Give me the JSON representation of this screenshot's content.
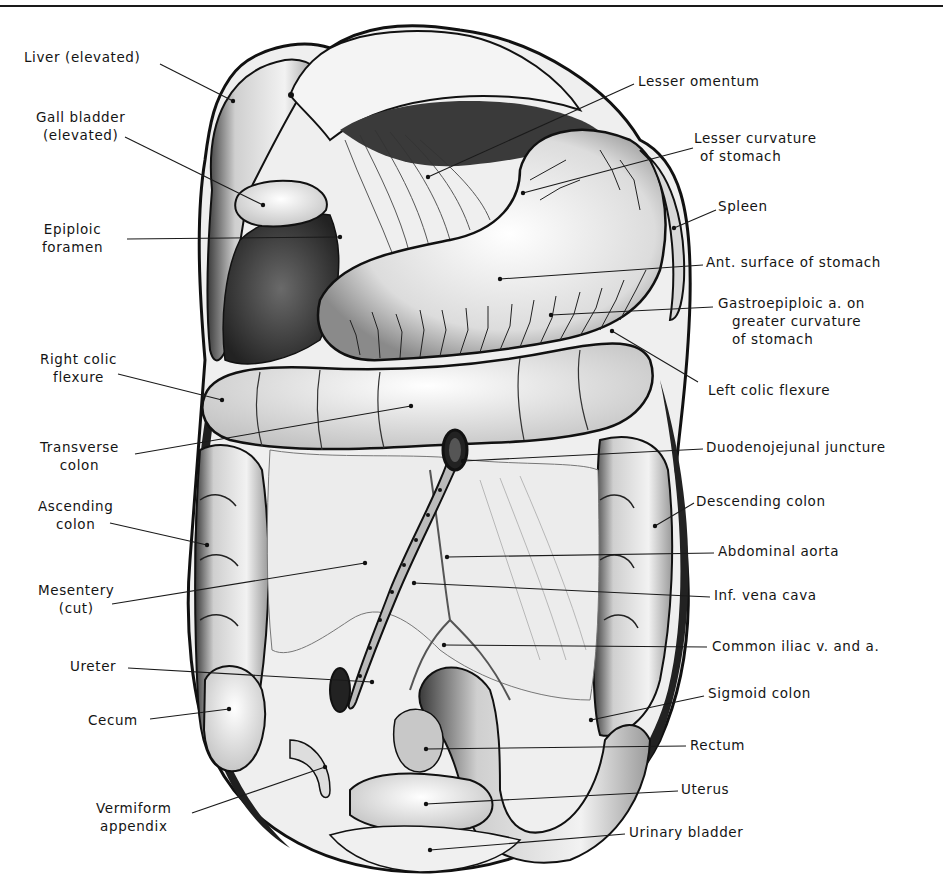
{
  "figure": {
    "colors": {
      "ink": "#141414",
      "paper": "#ffffff",
      "shade": "#6e6e6e",
      "dark": "#2a2a2a",
      "light": "#e4e4e4"
    }
  },
  "labels_left": [
    {
      "id": "liver",
      "line1": "Liver (elevated)",
      "line2": "",
      "x": 24,
      "y": 48,
      "anchor": [
        233,
        101
      ],
      "from": [
        160,
        64
      ]
    },
    {
      "id": "gall-bladder",
      "line1": "Gall bladder",
      "line2": "(elevated)",
      "x": 36,
      "y": 108,
      "anchor": [
        263,
        205
      ],
      "from": [
        125,
        137
      ]
    },
    {
      "id": "epiploic-foramen",
      "line1": "Epiploic",
      "line2": "foramen",
      "x": 42,
      "y": 220,
      "anchor": [
        340,
        237
      ],
      "from": [
        127,
        239
      ]
    },
    {
      "id": "right-colic-flexure",
      "line1": "Right colic",
      "line2": "flexure",
      "x": 40,
      "y": 350,
      "anchor": [
        222,
        400
      ],
      "from": [
        118,
        374
      ]
    },
    {
      "id": "transverse-colon",
      "line1": "Transverse",
      "line2": "colon",
      "x": 40,
      "y": 438,
      "anchor": [
        411,
        406
      ],
      "from": [
        135,
        454
      ]
    },
    {
      "id": "ascending-colon",
      "line1": "Ascending",
      "line2": "colon",
      "x": 38,
      "y": 497,
      "anchor": [
        207,
        545
      ],
      "from": [
        110,
        523
      ]
    },
    {
      "id": "mesentery",
      "line1": "Mesentery",
      "line2": "(cut)",
      "x": 38,
      "y": 581,
      "anchor": [
        365,
        563
      ],
      "from": [
        112,
        604
      ]
    },
    {
      "id": "ureter",
      "line1": "Ureter",
      "line2": "",
      "x": 70,
      "y": 657,
      "anchor": [
        372,
        682
      ],
      "from": [
        128,
        668
      ]
    },
    {
      "id": "cecum",
      "line1": "Cecum",
      "line2": "",
      "x": 88,
      "y": 711,
      "anchor": [
        229,
        709
      ],
      "from": [
        150,
        719
      ]
    },
    {
      "id": "vermiform-appendix",
      "line1": "Vermiform",
      "line2": "appendix",
      "x": 96,
      "y": 799,
      "anchor": [
        325,
        767
      ],
      "from": [
        192,
        813
      ]
    }
  ],
  "labels_right": [
    {
      "id": "lesser-omentum",
      "line1": "Lesser omentum",
      "line2": "",
      "x": 638,
      "y": 72,
      "anchor": [
        428,
        177
      ],
      "from": [
        634,
        84
      ]
    },
    {
      "id": "lesser-curvature",
      "line1": "Lesser curvature",
      "line2": "of stomach",
      "x": 694,
      "y": 129,
      "anchor": [
        523,
        193
      ],
      "from": [
        693,
        148
      ]
    },
    {
      "id": "spleen",
      "line1": "Spleen",
      "line2": "",
      "x": 718,
      "y": 197,
      "anchor": [
        674,
        228
      ],
      "from": [
        716,
        210
      ]
    },
    {
      "id": "ant-surface-stomach",
      "line1": "Ant. surface of stomach",
      "line2": "",
      "x": 706,
      "y": 253,
      "anchor": [
        500,
        279
      ],
      "from": [
        703,
        265
      ]
    },
    {
      "id": "gastroepiploic-artery",
      "line1": "Gastroepiploic a. on",
      "line2": "greater curvature",
      "line3": "of stomach",
      "x": 718,
      "y": 294,
      "anchor": [
        551,
        315
      ],
      "from": [
        713,
        307
      ]
    },
    {
      "id": "left-colic-flexure",
      "line1": "Left colic flexure",
      "line2": "",
      "x": 708,
      "y": 381,
      "anchor": [
        612,
        331
      ],
      "from": [
        698,
        382
      ]
    },
    {
      "id": "duodenojejunal-juncture",
      "line1": "Duodenojejunal juncture",
      "line2": "",
      "x": 706,
      "y": 438,
      "anchor": [
        463,
        461
      ],
      "from": [
        703,
        449
      ]
    },
    {
      "id": "descending-colon",
      "line1": "Descending colon",
      "line2": "",
      "x": 696,
      "y": 492,
      "anchor": [
        655,
        526
      ],
      "from": [
        694,
        503
      ]
    },
    {
      "id": "abdominal-aorta",
      "line1": "Abdominal aorta",
      "line2": "",
      "x": 718,
      "y": 542,
      "anchor": [
        447,
        557
      ],
      "from": [
        714,
        553
      ]
    },
    {
      "id": "inf-vena-cava",
      "line1": "Inf. vena cava",
      "line2": "",
      "x": 714,
      "y": 586,
      "anchor": [
        414,
        583
      ],
      "from": [
        710,
        597
      ]
    },
    {
      "id": "common-iliac",
      "line1": "Common iliac v. and a.",
      "line2": "",
      "x": 712,
      "y": 637,
      "anchor": [
        444,
        645
      ],
      "from": [
        707,
        647
      ]
    },
    {
      "id": "sigmoid-colon",
      "line1": "Sigmoid colon",
      "line2": "",
      "x": 708,
      "y": 684,
      "anchor": [
        591,
        720
      ],
      "from": [
        704,
        696
      ]
    },
    {
      "id": "rectum",
      "line1": "Rectum",
      "line2": "",
      "x": 690,
      "y": 736,
      "anchor": [
        426,
        749
      ],
      "from": [
        686,
        746
      ]
    },
    {
      "id": "uterus",
      "line1": "Uterus",
      "line2": "",
      "x": 681,
      "y": 780,
      "anchor": [
        426,
        804
      ],
      "from": [
        678,
        791
      ]
    },
    {
      "id": "urinary-bladder",
      "line1": "Urinary bladder",
      "line2": "",
      "x": 629,
      "y": 823,
      "anchor": [
        430,
        850
      ],
      "from": [
        625,
        834
      ]
    }
  ]
}
